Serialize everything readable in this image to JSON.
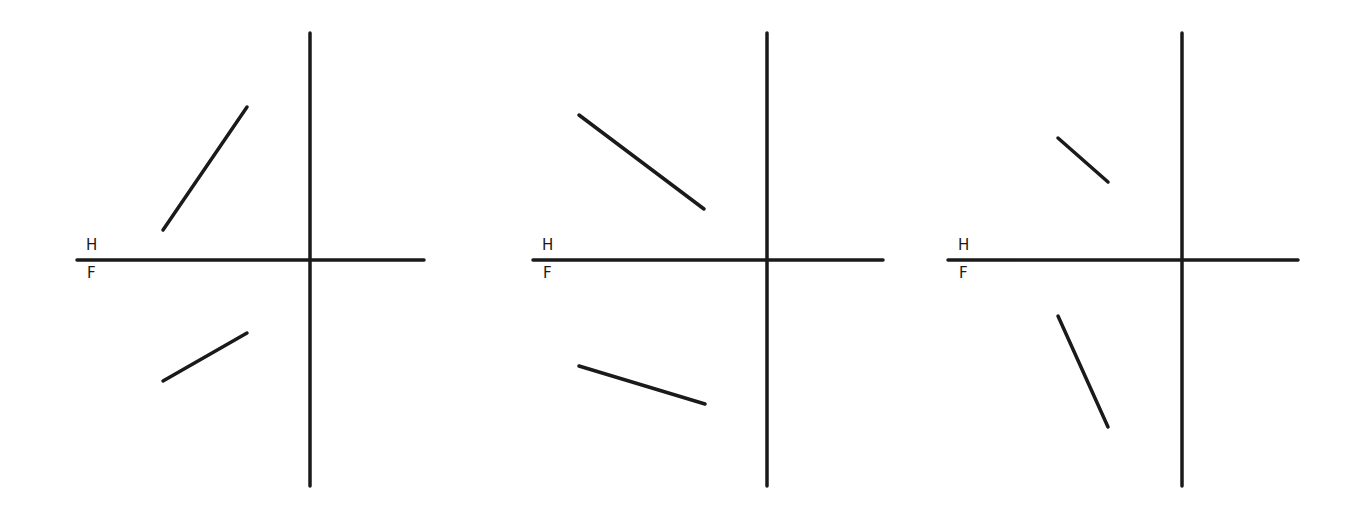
{
  "diagram": {
    "type": "orthographic-projection-line-views",
    "line_color": "#1a1a1a",
    "background": "#ffffff",
    "panels": [
      {
        "id": "panel-1",
        "labels": {
          "top": "H",
          "bottom": "F"
        },
        "folding_line": {
          "x1": 77,
          "y1": 260,
          "x2": 424,
          "y2": 260
        },
        "vertical_axis": {
          "x1": 310,
          "y1": 33,
          "x2": 310,
          "y2": 486
        },
        "top_view_line": {
          "x1": 163,
          "y1": 230,
          "x2": 247,
          "y2": 107
        },
        "front_view_line": {
          "x1": 163,
          "y1": 381,
          "x2": 247,
          "y2": 333
        }
      },
      {
        "id": "panel-2",
        "labels": {
          "top": "H",
          "bottom": "F"
        },
        "folding_line": {
          "x1": 533,
          "y1": 260,
          "x2": 883,
          "y2": 260
        },
        "vertical_axis": {
          "x1": 767,
          "y1": 33,
          "x2": 767,
          "y2": 486
        },
        "top_view_line": {
          "x1": 579,
          "y1": 115,
          "x2": 704,
          "y2": 209
        },
        "front_view_line": {
          "x1": 579,
          "y1": 366,
          "x2": 705,
          "y2": 404
        }
      },
      {
        "id": "panel-3",
        "labels": {
          "top": "H",
          "bottom": "F"
        },
        "folding_line": {
          "x1": 948,
          "y1": 260,
          "x2": 1298,
          "y2": 260
        },
        "vertical_axis": {
          "x1": 1182,
          "y1": 33,
          "x2": 1182,
          "y2": 486
        },
        "top_view_line": {
          "x1": 1058,
          "y1": 138,
          "x2": 1108,
          "y2": 182
        },
        "front_view_line": {
          "x1": 1058,
          "y1": 316,
          "x2": 1108,
          "y2": 427
        }
      }
    ]
  }
}
